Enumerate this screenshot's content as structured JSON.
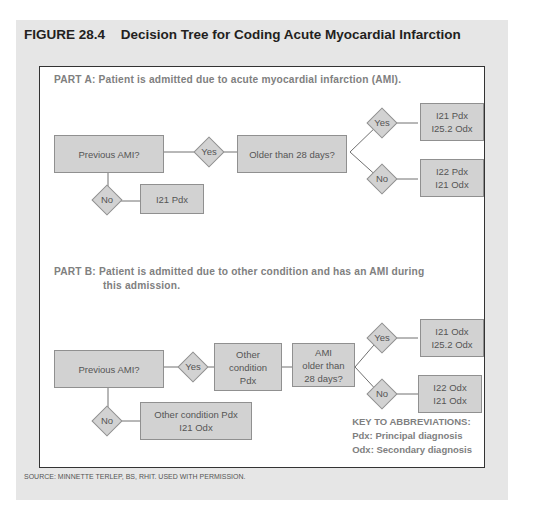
{
  "figure": {
    "number": "FIGURE 28.4",
    "title": "Decision Tree for Coding Acute Myocardial Infarction",
    "source": "SOURCE: MINNETTE TERLEP, BS, RHIT. USED WITH PERMISSION."
  },
  "part_a": {
    "heading": "PART A: Patient is admitted due to acute myocardial infarction (AMI).",
    "start": "Previous AMI?",
    "yes": "Yes",
    "no": "No",
    "question": "Older than 28 days?",
    "no_result": "I21 Pdx",
    "yes_yes": "Yes",
    "yes_no": "No",
    "yes_yes_result": "I21 Pdx\nI25.2 Odx",
    "yes_no_result": "I22 Pdx\nI21 Odx"
  },
  "part_b": {
    "heading_line1": "PART B: Patient is admitted due to other condition and has an AMI during",
    "heading_line2": "this admission.",
    "start": "Previous AMI?",
    "yes": "Yes",
    "no": "No",
    "other": "Other\ncondition\nPdx",
    "question": "AMI\nolder than\n28 days?",
    "no_result": "Other condition Pdx\nI21 Odx",
    "yes_yes": "Yes",
    "yes_no": "No",
    "yes_yes_result": "I21 Odx\nI25.2 Odx",
    "yes_no_result": "I22 Odx\nI21 Odx"
  },
  "key": {
    "title": "KEY TO ABBREVIATIONS:",
    "pdx": "Pdx: Principal diagnosis",
    "odx": "Odx: Secondary diagnosis"
  }
}
